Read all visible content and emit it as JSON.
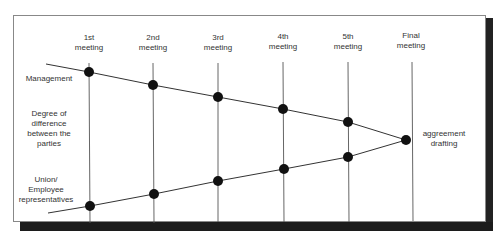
{
  "meetings": [
    {
      "label": "1st\nmeeting",
      "x": 89
    },
    {
      "label": "2nd\nmeeting",
      "x": 153
    },
    {
      "label": "3rd\nmeeting",
      "x": 218
    },
    {
      "label": "4th\nmeeting",
      "x": 283
    },
    {
      "label": "5th\nmeeting",
      "x": 348
    },
    {
      "label": "Final\nmeeting",
      "x": 412
    }
  ],
  "side_labels": {
    "management": "Management",
    "difference": "Degree of\ndifference\nbetween the\nparties",
    "union": "Union/\nEmployee\nrepresentatives"
  },
  "endpoint_label": "aggreement\ndrafting",
  "colors": {
    "line": "#333333",
    "dot": "#111111",
    "shadow": "#1c1c1c",
    "frame": "#888888"
  },
  "management_points": [
    [
      89,
      72
    ],
    [
      153,
      85
    ],
    [
      218,
      97
    ],
    [
      283,
      109
    ],
    [
      348,
      122
    ]
  ],
  "union_points": [
    [
      90,
      206
    ],
    [
      154,
      194
    ],
    [
      218,
      181
    ],
    [
      284,
      169
    ],
    [
      348,
      157
    ]
  ],
  "convergence_point": [
    406,
    140
  ]
}
